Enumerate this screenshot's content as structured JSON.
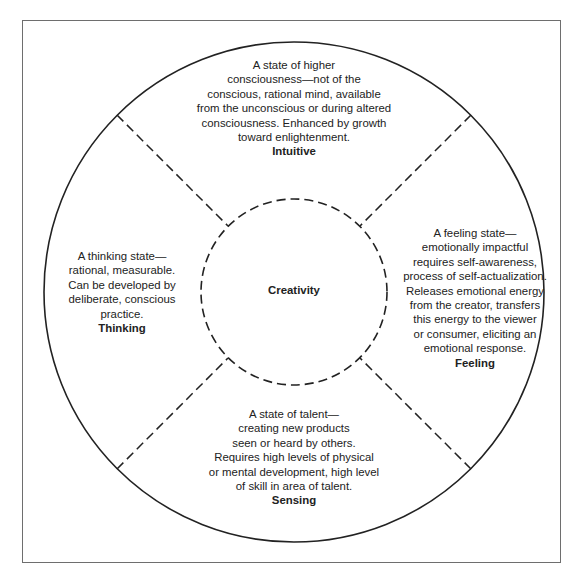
{
  "diagram": {
    "center": {
      "label": "Creativity"
    },
    "quadrants": {
      "intuitive": {
        "lines": [
          "A state of higher",
          "consciousness—not of the",
          "conscious, rational mind, available",
          "from the unconscious or during altered",
          "consciousness. Enhanced by growth",
          "toward enlightenment."
        ],
        "label": "Intuitive"
      },
      "thinking": {
        "lines": [
          "A thinking state—",
          "rational, measurable.",
          "Can be developed by",
          "deliberate, conscious",
          "practice."
        ],
        "label": "Thinking"
      },
      "feeling": {
        "lines": [
          "A feeling state—",
          "emotionally impactful",
          "requires self-awareness,",
          "process of self-actualization.",
          "Releases emotional energy",
          "from the creator, transfers",
          "this energy to the viewer",
          "or consumer, eliciting an",
          "emotional response."
        ],
        "label": "Feeling"
      },
      "sensing": {
        "lines": [
          "A state of talent—",
          "creating new products",
          "seen or heard by others.",
          "Requires high levels of physical",
          "or mental development, high level",
          "of skill in area of talent."
        ],
        "label": "Sensing"
      }
    },
    "colors": {
      "frame": "#6e6e6e",
      "lines": "#222222",
      "text": "#222222",
      "background": "#ffffff"
    }
  }
}
